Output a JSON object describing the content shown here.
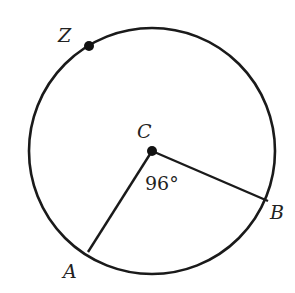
{
  "diagram": {
    "type": "circle-central-angle",
    "center_label": "C",
    "points": [
      {
        "id": "Z",
        "label": "Z",
        "on_circle": true,
        "marked": true
      },
      {
        "id": "A",
        "label": "A",
        "on_circle": true,
        "marked": false
      },
      {
        "id": "B",
        "label": "B",
        "on_circle": true,
        "marked": false
      }
    ],
    "radii": [
      "CA",
      "CB"
    ],
    "angle": {
      "vertex": "C",
      "between": [
        "A",
        "B"
      ],
      "label": "96°",
      "degrees": 96
    },
    "colors": {
      "stroke": "#1a1a1a",
      "text": "#222222"
    }
  }
}
